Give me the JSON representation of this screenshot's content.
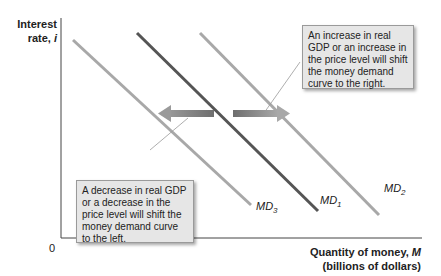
{
  "axes": {
    "y_label_line1": "Interest",
    "y_label_line2": "rate,",
    "y_label_var": "i",
    "origin": "0",
    "x_label_line1": "Quantity of money,",
    "x_label_var": "M",
    "x_label_line2": "(billions of dollars)"
  },
  "curves": [
    {
      "name": "MD",
      "sub": "3",
      "color": "#a8a8a8",
      "role": "shifted left"
    },
    {
      "name": "MD",
      "sub": "1",
      "color": "#555555",
      "role": "original"
    },
    {
      "name": "MD",
      "sub": "2",
      "color": "#a8a8a8",
      "role": "shifted right"
    }
  ],
  "notes": {
    "right": "An increase in real GDP or an increase in the price level will shift the money demand curve to the right.",
    "left": "A decrease in real GDP or a decrease in the price level will shift the money demand curve to the left."
  },
  "colors": {
    "axis": "#444444",
    "arrow": "#808080",
    "note_bg": "#e6e6e6"
  }
}
